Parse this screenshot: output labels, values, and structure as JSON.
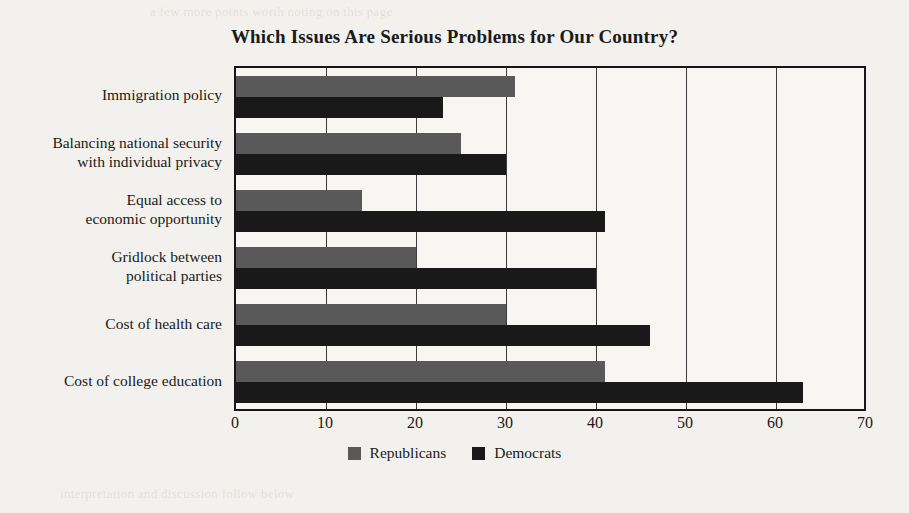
{
  "chart_data": {
    "type": "bar",
    "orientation": "horizontal",
    "title": "Which Issues Are Serious Problems for Our Country?",
    "xlabel": "",
    "ylabel": "",
    "xlim": [
      0,
      70
    ],
    "xticks": [
      0,
      10,
      20,
      30,
      40,
      50,
      60,
      70
    ],
    "grid": true,
    "legend_position": "bottom",
    "categories": [
      "Immigration policy",
      "Balancing national security\nwith individual privacy",
      "Equal access to\neconomic opportunity",
      "Gridlock between\npolitical parties",
      "Cost of health care",
      "Cost of college education"
    ],
    "series": [
      {
        "name": "Republicans",
        "color": "#595959",
        "values": [
          31,
          25,
          14,
          20,
          30,
          41
        ]
      },
      {
        "name": "Democrats",
        "color": "#19191a",
        "values": [
          23,
          30,
          41,
          40,
          46,
          63
        ]
      }
    ]
  },
  "legend": [
    {
      "label": "Republicans",
      "color": "#595959"
    },
    {
      "label": "Democrats",
      "color": "#19191a"
    }
  ],
  "page_artifacts": {
    "ghost_top": "a few more points worth noting on this page",
    "ghost_mid": "survey results reported by percentage",
    "ghost_mid2": "data collected from national sample",
    "ghost_bottom": "interpretation and discussion follow below"
  }
}
